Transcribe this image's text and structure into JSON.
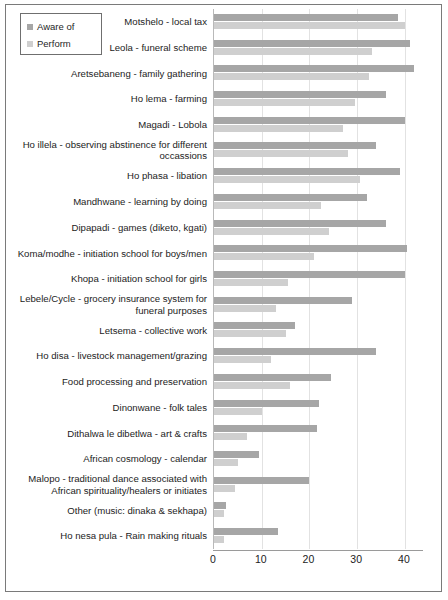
{
  "legend": {
    "items": [
      {
        "label": "Aware of",
        "color": "#a6a6a6",
        "icon": "legend-swatch-square"
      },
      {
        "label": "Perform",
        "color": "#cfcfcf",
        "icon": "legend-swatch-square"
      }
    ]
  },
  "axis": {
    "x_ticks": [
      "0",
      "10",
      "20",
      "30",
      "40"
    ]
  },
  "chart_data": {
    "type": "bar",
    "orientation": "horizontal",
    "title": "",
    "xlabel": "",
    "ylabel": "",
    "xlim": [
      0,
      44
    ],
    "grid": true,
    "legend_position": "top-left",
    "xticks": [
      0,
      10,
      20,
      30,
      40
    ],
    "categories": [
      "Motshelo - local tax",
      "Leola - funeral scheme",
      "Aretsebaneng - family gathering",
      "Ho lema - farming",
      "Magadi - Lobola",
      "Ho illela - observing abstinence for different occassions",
      "Ho phasa - libation",
      "Mandhwane - learning by doing",
      "Dipapadi - games (diketo, kgati)",
      "Koma/modhe - initiation school for  boys/men",
      "Khopa - initiation school for girls",
      "Lebele/Cycle - grocery insurance system for funeral purposes",
      "Letsema - collective work",
      "Ho disa - livestock management/grazing",
      "Food processing and preservation",
      "Dinonwane - folk tales",
      "Dithalwa le dibetlwa - art & crafts",
      "African cosmology - calendar",
      "Malopo - traditional dance associated with African spirituality/healers or initiates",
      "Other (music: dinaka & sekhapa)",
      "Ho nesa pula - Rain making rituals"
    ],
    "series": [
      {
        "name": "Aware of",
        "color": "#a6a6a6",
        "values": [
          38.5,
          41,
          42,
          36,
          40,
          34,
          39,
          32,
          36,
          40.5,
          40,
          29,
          17,
          34,
          24.5,
          22,
          21.5,
          9.5,
          20,
          2.5,
          13.5
        ]
      },
      {
        "name": "Perform",
        "color": "#cfcfcf",
        "values": [
          40,
          33,
          32.5,
          29.5,
          27,
          28,
          30.5,
          22.5,
          24,
          21,
          15.5,
          13,
          15,
          12,
          16,
          10,
          7,
          5,
          4.5,
          2,
          2
        ]
      }
    ]
  }
}
